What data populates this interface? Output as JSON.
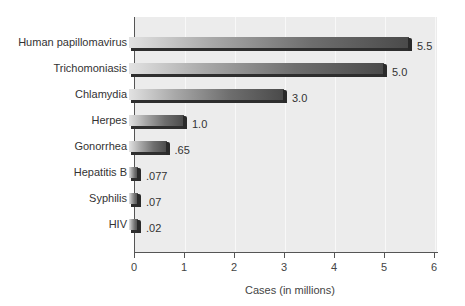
{
  "chart_data": {
    "type": "bar",
    "orientation": "horizontal",
    "title": "",
    "xlabel": "Cases (in millions)",
    "ylabel": "",
    "xlim": [
      0,
      6
    ],
    "xticks": [
      "0",
      "1",
      "2",
      "3",
      "4",
      "5",
      "6"
    ],
    "grid": true,
    "legend": null,
    "categories": [
      "Human papillomavirus",
      "Trichomoniasis",
      "Chlamydia",
      "Herpes",
      "Gonorrhea",
      "Hepatitis B",
      "Syphilis",
      "HIV"
    ],
    "values": [
      5.5,
      5.0,
      3.0,
      1.0,
      0.65,
      0.077,
      0.07,
      0.02
    ],
    "value_labels": [
      "5.5",
      "5.0",
      "3.0",
      "1.0",
      ".65",
      ".077",
      ".07",
      ".02"
    ]
  },
  "colors": {
    "plot_background": "#ececec",
    "bar_light": "#e2e2e2",
    "bar_dark": "#4a4a4a",
    "bar_edge": "#2e2e2e",
    "axis": "#555555"
  }
}
